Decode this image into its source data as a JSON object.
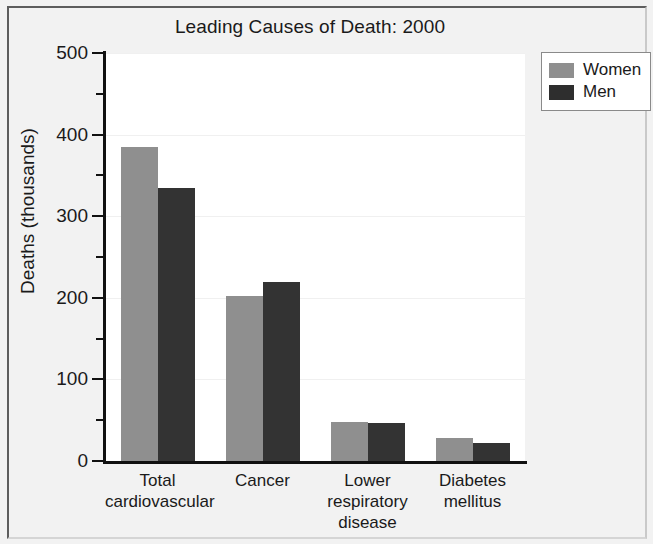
{
  "chart_data": {
    "type": "bar",
    "title": "Leading Causes of Death: 2000",
    "xlabel": "",
    "ylabel": "Deaths (thousands)",
    "ylim": [
      0,
      500
    ],
    "ytick_labels": [
      "0",
      "100",
      "200",
      "300",
      "400",
      "500"
    ],
    "ytick_values": [
      0,
      100,
      200,
      300,
      400,
      500
    ],
    "yminor_values": [
      50,
      150,
      250,
      350,
      450
    ],
    "grid": true,
    "legend_position": "top-right",
    "categories": [
      "Total cardiovascular",
      "Cancer",
      "Lower respiratory disease",
      "Diabetes mellitus"
    ],
    "category_lines": [
      [
        "Total",
        "cardiovascular"
      ],
      [
        "Cancer"
      ],
      [
        "Lower",
        "respiratory",
        "disease"
      ],
      [
        "Diabetes",
        "mellitus"
      ]
    ],
    "series": [
      {
        "name": "Women",
        "color": "#8f8f8f",
        "values": [
          385,
          202,
          48,
          28
        ]
      },
      {
        "name": "Men",
        "color": "#333333",
        "values": [
          335,
          219,
          46,
          22
        ]
      }
    ]
  },
  "legend": {
    "entries": [
      {
        "label": "Women",
        "swatch": "women"
      },
      {
        "label": "Men",
        "swatch": "men"
      }
    ]
  }
}
